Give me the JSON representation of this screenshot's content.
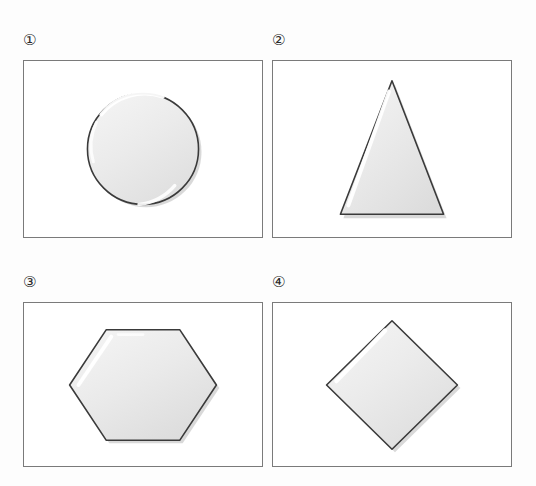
{
  "page": {
    "background_color": "#fdfdfd",
    "panel_border_color": "#7a7a7a",
    "shape_outline_color": "#3a3a3a",
    "shape_fill_light": "#f3f3f3",
    "shape_fill_dark": "#dcdcdc",
    "highlight_color": "#ffffff",
    "shadow_color": "#b4b4b4"
  },
  "panels": [
    {
      "marker": "①",
      "number": 1,
      "shape_name": "circle",
      "shape_label": "Circle",
      "sides": 0,
      "geometry": {
        "cx": 120,
        "cy": 89,
        "r": 56
      }
    },
    {
      "marker": "②",
      "number": 2,
      "shape_name": "triangle",
      "shape_label": "Triangle",
      "sides": 3,
      "geometry": {
        "points": "120,18 68,153 172,153"
      }
    },
    {
      "marker": "③",
      "number": 3,
      "shape_name": "hexagon",
      "shape_label": "Hexagon",
      "sides": 6,
      "geometry": {
        "points": "83,27 157,27 194,83 157,139 83,139 46,83"
      }
    },
    {
      "marker": "④",
      "number": 4,
      "shape_name": "diamond",
      "shape_label": "Diamond",
      "sides": 4,
      "geometry": {
        "points": "120,18 186,83 120,148 54,83"
      }
    }
  ]
}
